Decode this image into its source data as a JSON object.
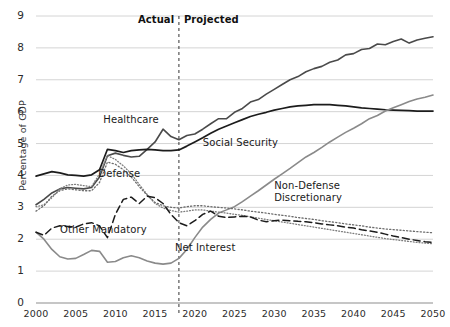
{
  "chart_data": {
    "type": "line",
    "title": "",
    "xlabel": "",
    "ylabel": "Percentage of GDP",
    "xlim": [
      2000,
      2050
    ],
    "ylim": [
      0,
      9
    ],
    "grid": true,
    "legend_position": "inline-annotations",
    "xticks": [
      "2000",
      "2005",
      "2010",
      "2015",
      "2020",
      "2025",
      "2030",
      "2035",
      "2040",
      "2045",
      "2050"
    ],
    "yticks": [
      "0",
      "1",
      "2",
      "3",
      "4",
      "5",
      "6",
      "7",
      "8",
      "9"
    ],
    "divider": {
      "x": 2018,
      "left_label": "Actual",
      "right_label": "Projected",
      "style": "dashed"
    },
    "x": [
      2000,
      2001,
      2002,
      2003,
      2004,
      2005,
      2006,
      2007,
      2008,
      2009,
      2010,
      2011,
      2012,
      2013,
      2014,
      2015,
      2016,
      2017,
      2018,
      2019,
      2020,
      2021,
      2022,
      2023,
      2024,
      2025,
      2026,
      2027,
      2028,
      2029,
      2030,
      2031,
      2032,
      2033,
      2034,
      2035,
      2036,
      2037,
      2038,
      2039,
      2040,
      2041,
      2042,
      2043,
      2044,
      2045,
      2046,
      2047,
      2048,
      2049,
      2050
    ],
    "series": [
      {
        "name": "Healthcare",
        "color": "#4a4a4a",
        "style": "solid",
        "width": 1.6,
        "label_pos": {
          "x": 2012,
          "y": 5.75
        },
        "values": [
          3.08,
          3.25,
          3.45,
          3.58,
          3.62,
          3.6,
          3.58,
          3.62,
          3.95,
          4.62,
          4.7,
          4.63,
          4.58,
          4.6,
          4.82,
          5.05,
          5.45,
          5.22,
          5.12,
          5.25,
          5.3,
          5.45,
          5.62,
          5.78,
          5.78,
          5.98,
          6.1,
          6.3,
          6.38,
          6.55,
          6.7,
          6.85,
          7.0,
          7.1,
          7.25,
          7.35,
          7.42,
          7.55,
          7.62,
          7.78,
          7.82,
          7.95,
          7.98,
          8.12,
          8.1,
          8.2,
          8.28,
          8.15,
          8.25,
          8.3,
          8.35
        ]
      },
      {
        "name": "Social Security",
        "color": "#1c1c1c",
        "style": "solid",
        "width": 1.7,
        "label_pos": {
          "x": 2021,
          "y": 5.02
        },
        "values": [
          3.98,
          4.05,
          4.12,
          4.08,
          4.02,
          4.0,
          3.98,
          4.02,
          4.18,
          4.82,
          4.78,
          4.72,
          4.78,
          4.8,
          4.82,
          4.8,
          4.78,
          4.78,
          4.8,
          4.92,
          5.05,
          5.18,
          5.32,
          5.45,
          5.55,
          5.65,
          5.75,
          5.85,
          5.92,
          5.98,
          6.05,
          6.1,
          6.15,
          6.18,
          6.2,
          6.22,
          6.22,
          6.22,
          6.2,
          6.18,
          6.15,
          6.12,
          6.1,
          6.08,
          6.06,
          6.05,
          6.04,
          6.03,
          6.02,
          6.02,
          6.02
        ]
      },
      {
        "name": "Net Interest",
        "color": "#8a8a8a",
        "style": "solid",
        "width": 1.6,
        "label_pos": {
          "x": 2017.5,
          "y": 1.72
        },
        "values": [
          2.22,
          2.0,
          1.68,
          1.45,
          1.38,
          1.4,
          1.52,
          1.65,
          1.62,
          1.28,
          1.3,
          1.42,
          1.48,
          1.42,
          1.32,
          1.25,
          1.22,
          1.25,
          1.4,
          1.68,
          2.05,
          2.38,
          2.62,
          2.82,
          2.92,
          3.02,
          3.18,
          3.35,
          3.52,
          3.7,
          3.88,
          4.05,
          4.22,
          4.4,
          4.58,
          4.72,
          4.88,
          5.05,
          5.2,
          5.35,
          5.48,
          5.62,
          5.78,
          5.88,
          6.02,
          6.12,
          6.22,
          6.32,
          6.4,
          6.45,
          6.52
        ]
      },
      {
        "name": "Defense",
        "color": "#7d7d7d",
        "style": "dotted-fine",
        "width": 1.3,
        "label_pos": {
          "x": 2010.5,
          "y": 4.05
        },
        "values": [
          3.02,
          3.08,
          3.3,
          3.58,
          3.7,
          3.72,
          3.68,
          3.65,
          4.05,
          4.62,
          4.5,
          4.3,
          4.05,
          3.72,
          3.4,
          3.12,
          2.98,
          2.9,
          2.85,
          2.88,
          2.92,
          2.92,
          2.88,
          2.85,
          2.82,
          2.78,
          2.75,
          2.7,
          2.66,
          2.62,
          2.58,
          2.54,
          2.5,
          2.46,
          2.42,
          2.38,
          2.34,
          2.3,
          2.26,
          2.22,
          2.18,
          2.14,
          2.1,
          2.06,
          2.02,
          1.99,
          1.96,
          1.93,
          1.9,
          1.88,
          1.86
        ]
      },
      {
        "name": "Non-Defense Discretionary",
        "color": "#6d6d6d",
        "style": "dotted",
        "width": 1.3,
        "label_pos": {
          "x": 2030,
          "y": 3.68
        },
        "values": [
          2.88,
          3.05,
          3.35,
          3.52,
          3.58,
          3.55,
          3.52,
          3.52,
          3.78,
          4.42,
          4.35,
          4.18,
          3.95,
          3.65,
          3.38,
          3.15,
          3.05,
          3.0,
          2.98,
          3.02,
          3.05,
          3.05,
          3.02,
          3.0,
          2.98,
          2.95,
          2.92,
          2.88,
          2.85,
          2.82,
          2.78,
          2.75,
          2.72,
          2.68,
          2.65,
          2.62,
          2.58,
          2.55,
          2.52,
          2.48,
          2.45,
          2.42,
          2.38,
          2.35,
          2.32,
          2.3,
          2.28,
          2.26,
          2.24,
          2.22,
          2.2
        ]
      },
      {
        "name": "Other Mandatory",
        "color": "#1c1c1c",
        "style": "dashed",
        "width": 1.5,
        "label_pos": {
          "x": 2008.5,
          "y": 2.28
        },
        "values": [
          2.22,
          2.12,
          2.35,
          2.42,
          2.4,
          2.38,
          2.48,
          2.52,
          2.42,
          2.05,
          2.78,
          3.25,
          3.32,
          3.12,
          3.35,
          3.3,
          3.12,
          2.78,
          2.52,
          2.42,
          2.58,
          2.78,
          2.88,
          2.72,
          2.68,
          2.7,
          2.72,
          2.7,
          2.6,
          2.55,
          2.58,
          2.6,
          2.58,
          2.56,
          2.55,
          2.52,
          2.48,
          2.45,
          2.42,
          2.38,
          2.35,
          2.3,
          2.26,
          2.22,
          2.16,
          2.1,
          2.05,
          2.0,
          1.96,
          1.92,
          1.9
        ]
      }
    ]
  },
  "axis": {
    "y_title": "Percentage of GDP"
  }
}
